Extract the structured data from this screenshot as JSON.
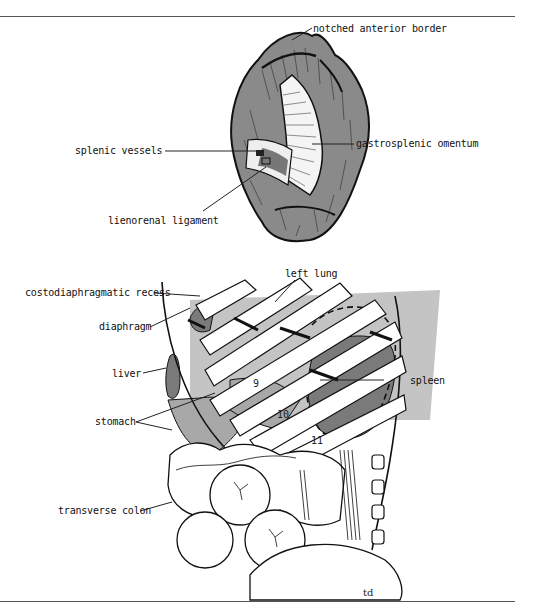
{
  "figure": {
    "top_panel": {
      "subject": "spleen (visceral surface)",
      "labels": [
        {
          "id": "notched-anterior-border",
          "text": "notched anterior border"
        },
        {
          "id": "splenic-vessels",
          "text": "splenic vessels"
        },
        {
          "id": "gastrosplenic-omentum",
          "text": "gastrosplenic omentum"
        },
        {
          "id": "lienorenal-ligament",
          "text": "lienorenal ligament"
        }
      ]
    },
    "bottom_panel": {
      "subject": "spleen position relative to ribs",
      "labels": [
        {
          "id": "left-lung",
          "text": "left lung"
        },
        {
          "id": "costodiaphragmatic-recess",
          "text": "costodiaphragmatic recess"
        },
        {
          "id": "diaphragm",
          "text": "diaphragm"
        },
        {
          "id": "liver",
          "text": "liver"
        },
        {
          "id": "spleen",
          "text": "spleen"
        },
        {
          "id": "stomach",
          "text": "stomach"
        },
        {
          "id": "transverse-colon",
          "text": "transverse colon"
        }
      ],
      "rib_numbers": [
        "9",
        "10",
        "11"
      ]
    },
    "artist_signature": "td"
  },
  "colors": {
    "spleen_fill": "#8a8a8a",
    "light_gray": "#c4c4c4",
    "mid_gray": "#a8a8a8",
    "dark_gray": "#7a7a7a",
    "outline": "#111111"
  }
}
